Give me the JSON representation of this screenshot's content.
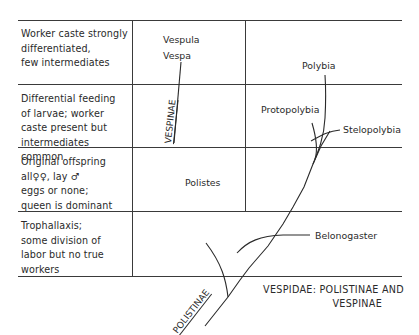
{
  "rows": [
    {
      "label": "Worker caste strongly differentiated, few intermediates",
      "lines": [
        "Worker caste strongly",
        "differentiated,",
        "few intermediates"
      ]
    },
    {
      "label": "Differential feeding of larvae; worker caste present but intermediates common",
      "lines": [
        "Differential feeding",
        "of larvae; worker",
        "caste present but",
        "intermediates common"
      ]
    },
    {
      "label": "Original offspring all ♀♀, lay ♂ eggs or none; queen is dominant",
      "lines": [
        "Original offspring",
        "all♀♀, lay ♂",
        "eggs or none;",
        "queen is dominant"
      ]
    },
    {
      "label": "Trophallaxis; some division of labor but no true workers",
      "lines": [
        "Trophallaxis;",
        "some division of",
        "labor but no true",
        "workers"
      ]
    }
  ],
  "taxa": {
    "vespula": "Vespula",
    "vespa": "Vespa",
    "polybia": "Polybia",
    "protopolybia": "Protopolybia",
    "stelopolybia": "Stelopolybia",
    "polistes": "Polistes",
    "belonogaster": "Belonogaster"
  },
  "subfamilies": {
    "vespinae": "VESPINAE",
    "polistinae": "POLISTINAE"
  },
  "caption": {
    "line1": "VESPIDAE: POLISTINAE AND",
    "line2": "VESPINAE"
  },
  "colors": {
    "ink": "#2a2a2a",
    "grid": "#3a3a3a",
    "background": "#ffffff"
  }
}
